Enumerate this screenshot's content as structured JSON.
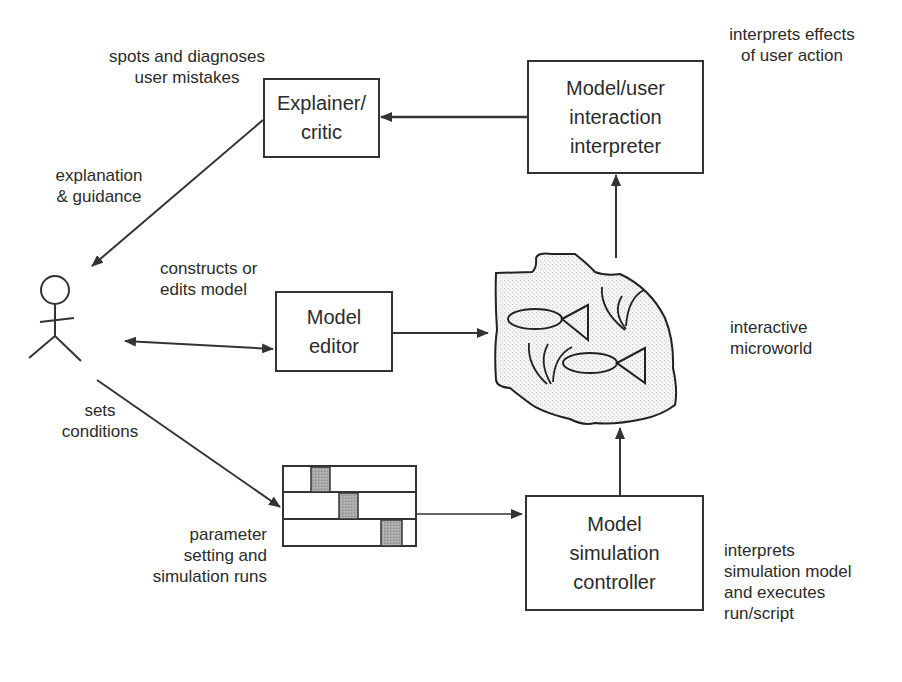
{
  "diagram": {
    "boxes": {
      "explainer": "Explainer/\ncritic",
      "interpreter": "Model/user\ninteraction\ninterpreter",
      "editor": "Model\neditor",
      "controller": "Model\nsimulation\ncontroller"
    },
    "annotations": {
      "spots": "spots and diagnoses\nuser mistakes",
      "interprets_effects": "interprets effects\nof user action",
      "explanation": "explanation\n& guidance",
      "constructs": "constructs or\nedits model",
      "microworld": "interactive\nmicroworld",
      "sets": "sets\nconditions",
      "parameter": "parameter\nsetting and\nsimulation runs",
      "interprets_sim": "interprets\nsimulation model\nand executes\nrun/script"
    },
    "nodes": [
      "user (stick figure)",
      "Explainer/critic",
      "Model/user interaction interpreter",
      "Model editor",
      "interactive microworld",
      "parameter setting panel",
      "Model simulation controller"
    ],
    "edges": [
      {
        "from": "Model/user interaction interpreter",
        "to": "Explainer/critic"
      },
      {
        "from": "Explainer/critic",
        "to": "user",
        "label": "explanation & guidance"
      },
      {
        "from": "user",
        "to": "Model editor",
        "label": "constructs or edits model",
        "bidirectional": true
      },
      {
        "from": "Model editor",
        "to": "interactive microworld"
      },
      {
        "from": "interactive microworld",
        "to": "Model/user interaction interpreter"
      },
      {
        "from": "user",
        "to": "parameter setting panel",
        "label": "sets conditions"
      },
      {
        "from": "parameter setting panel",
        "to": "Model simulation controller"
      },
      {
        "from": "Model simulation controller",
        "to": "interactive microworld"
      }
    ],
    "colors": {
      "line": "#333333",
      "fill_shade": "#b8b8b8",
      "background": "#ffffff"
    }
  }
}
